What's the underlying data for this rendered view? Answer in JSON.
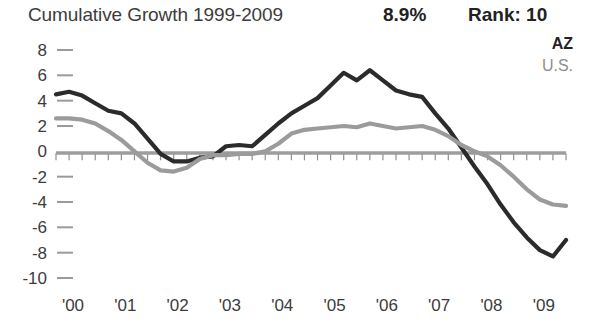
{
  "header": {
    "title": "Cumulative Growth 1999-2009",
    "value": "8.9%",
    "rank": "Rank: 10"
  },
  "legend": {
    "items": [
      {
        "label": "AZ",
        "color": "#2b2b2b"
      },
      {
        "label": "U.S.",
        "color": "#9b9b9b"
      }
    ]
  },
  "chart_data": {
    "type": "line",
    "title": "Cumulative Growth 1999-2009",
    "xlabel": "",
    "ylabel": "",
    "grid": false,
    "legend_position": "top-right",
    "ylim": [
      -10,
      8
    ],
    "ytick_labels": [
      "8",
      "6",
      "4",
      "2",
      "0",
      "-2",
      "-4",
      "-6",
      "-8",
      "-10"
    ],
    "ytick_values": [
      8,
      6,
      4,
      2,
      0,
      -2,
      -4,
      -6,
      -8,
      -10
    ],
    "xtick_labels": [
      "'00",
      "'01",
      "'02",
      "'03",
      "'04",
      "'05",
      "'06",
      "'07",
      "'08",
      "'09"
    ],
    "xtick_values": [
      2000,
      2001,
      2002,
      2003,
      2004,
      2005,
      2006,
      2007,
      2008,
      2009
    ],
    "xlim": [
      2000,
      2009.75
    ],
    "x": [
      2000.0,
      2000.25,
      2000.5,
      2000.75,
      2001.0,
      2001.25,
      2001.5,
      2001.75,
      2002.0,
      2002.25,
      2002.5,
      2002.75,
      2003.0,
      2003.25,
      2003.5,
      2003.75,
      2004.0,
      2004.25,
      2004.5,
      2004.75,
      2005.0,
      2005.25,
      2005.5,
      2005.75,
      2006.0,
      2006.25,
      2006.5,
      2006.75,
      2007.0,
      2007.25,
      2007.5,
      2007.75,
      2008.0,
      2008.25,
      2008.5,
      2008.75,
      2009.0,
      2009.25,
      2009.5,
      2009.75
    ],
    "series": [
      {
        "name": "AZ",
        "color": "#2b2b2b",
        "values": [
          4.5,
          4.7,
          4.4,
          3.8,
          3.2,
          3.0,
          2.2,
          1.0,
          -0.2,
          -0.8,
          -0.8,
          -0.5,
          -0.4,
          0.4,
          0.5,
          0.4,
          1.3,
          2.2,
          3.0,
          3.6,
          4.2,
          5.2,
          6.2,
          5.6,
          6.4,
          5.6,
          4.8,
          4.5,
          4.3,
          3.0,
          1.8,
          0.3,
          -1.2,
          -2.6,
          -4.2,
          -5.6,
          -6.8,
          -7.8,
          -8.3,
          -7.0
        ]
      },
      {
        "name": "U.S.",
        "color": "#9b9b9b",
        "values": [
          2.6,
          2.6,
          2.5,
          2.2,
          1.6,
          0.9,
          0.0,
          -0.9,
          -1.5,
          -1.6,
          -1.3,
          -0.6,
          -0.3,
          -0.3,
          -0.2,
          -0.2,
          0.0,
          0.6,
          1.4,
          1.7,
          1.8,
          1.9,
          2.0,
          1.9,
          2.2,
          2.0,
          1.8,
          1.9,
          2.0,
          1.7,
          1.2,
          0.5,
          0.0,
          -0.4,
          -1.1,
          -2.0,
          -3.0,
          -3.8,
          -4.2,
          -4.3
        ]
      }
    ]
  }
}
